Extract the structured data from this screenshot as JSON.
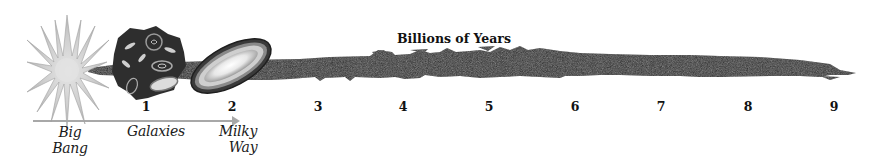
{
  "diagram": {
    "title": "Billions of Years",
    "type": "timeline",
    "ticks": [
      {
        "label": "1",
        "x": 146
      },
      {
        "label": "2",
        "x": 232
      },
      {
        "label": "3",
        "x": 318
      },
      {
        "label": "4",
        "x": 403
      },
      {
        "label": "5",
        "x": 489
      },
      {
        "label": "6",
        "x": 575
      },
      {
        "label": "7",
        "x": 661
      },
      {
        "label": "8",
        "x": 748
      },
      {
        "label": "9",
        "x": 834
      }
    ],
    "stages": [
      {
        "label_line1": "Big",
        "label_line2": "Bang",
        "icon": "starburst-icon"
      },
      {
        "label_line1": "Galaxies",
        "label_line2": "",
        "icon": "galaxy-cluster-icon"
      },
      {
        "label_line1": "Milky",
        "label_line2": "Way",
        "icon": "spiral-galaxy-disk-icon"
      }
    ],
    "colors": {
      "band": "#2b2b2b",
      "starburst": "#c8c8c8",
      "arrow": "#a8a8a8",
      "text": "#111111"
    }
  }
}
